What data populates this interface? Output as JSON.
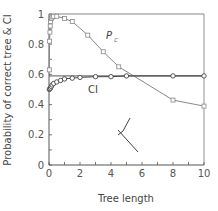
{
  "chart_data": {
    "type": "line",
    "title": "",
    "xlabel": "Tree length",
    "ylabel": "Probability of correct tree & CI",
    "xlim": [
      0,
      10
    ],
    "ylim": [
      0,
      1
    ],
    "xticks": [
      "0",
      "2",
      "4",
      "6",
      "8",
      "10"
    ],
    "yticks": [
      "0",
      "0.2",
      "0.4",
      "0.6",
      "0.8",
      "1"
    ],
    "grid": false,
    "series": [
      {
        "name": "Pc",
        "marker": "square",
        "color": "#888888",
        "x": [
          0.02,
          0.04,
          0.06,
          0.08,
          0.1,
          0.15,
          0.2,
          0.3,
          0.5,
          1,
          1.5,
          2.5,
          3.5,
          4.5,
          8,
          10
        ],
        "y": [
          0.63,
          0.82,
          0.88,
          0.92,
          0.95,
          0.97,
          0.98,
          0.985,
          0.985,
          0.97,
          0.95,
          0.86,
          0.75,
          0.65,
          0.43,
          0.39
        ]
      },
      {
        "name": "CI",
        "marker": "circle",
        "color": "#444444",
        "x": [
          0.02,
          0.05,
          0.1,
          0.15,
          0.2,
          0.3,
          0.5,
          0.75,
          1,
          1.5,
          2,
          3,
          4,
          5,
          8,
          10
        ],
        "y": [
          0.5,
          0.505,
          0.51,
          0.52,
          0.53,
          0.54,
          0.55,
          0.56,
          0.57,
          0.575,
          0.58,
          0.585,
          0.585,
          0.59,
          0.59,
          0.59
        ]
      }
    ],
    "reference_lines": [
      {
        "y": 1.0
      },
      {
        "y": 0.59
      }
    ],
    "annotations": [
      {
        "text": "P",
        "sub": "c",
        "x": 3.5,
        "y": 0.86
      },
      {
        "text": "CI",
        "x": 2.6,
        "y": 0.53
      }
    ],
    "inset": "unrooted three-taxon tree (stick figure)"
  }
}
